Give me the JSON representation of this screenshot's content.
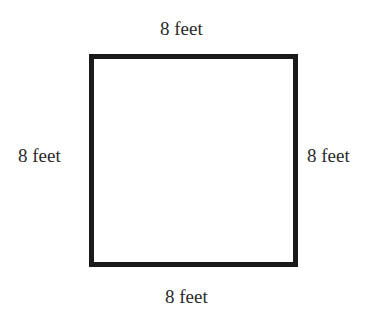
{
  "diagram": {
    "shape": "square",
    "labels": {
      "top": "8 feet",
      "left": "8 feet",
      "right": "8 feet",
      "bottom": "8 feet"
    },
    "colors": {
      "stroke": "#1a1a1a",
      "text": "#2a2a2a",
      "background": "#ffffff"
    }
  }
}
